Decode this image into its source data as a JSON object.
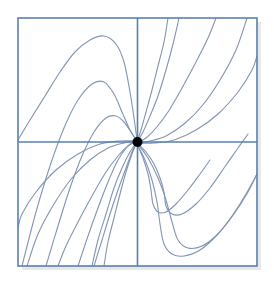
{
  "figure": {
    "alt_text": "Square plot frame with horizontal and vertical axes crossing at a filled black dot at the origin; a family of smooth blue trajectory curves spirals into the origin with 180-degree rotational symmetry.",
    "background_color": "#ffffff"
  },
  "frame": {
    "name": "plot-border",
    "x": 18,
    "y": 18,
    "width": 239,
    "height": 248,
    "stroke_color": "#5b7fb0",
    "stroke_width": 1.6,
    "fill_color": "#ffffff",
    "shadow_color": "#e6e8ea"
  },
  "axes": {
    "x_axis": {
      "label": "horizontal-axis",
      "y": 142,
      "x_start": 18,
      "x_end": 257,
      "stroke_color": "#5b7fb0",
      "stroke_width": 1.6
    },
    "y_axis": {
      "label": "vertical-axis",
      "x": 137.5,
      "y_start": 18,
      "y_end": 266,
      "stroke_color": "#5b7fb0",
      "stroke_width": 1.6
    }
  },
  "critical_point": {
    "name": "origin-node",
    "cx": 137.5,
    "cy": 142,
    "radius": 5,
    "fill_color": "#000000"
  },
  "curve_style": {
    "stroke_color": "#8294b4",
    "stroke_width": 1.1,
    "fill": "none"
  },
  "chart_data": {
    "type": "line",
    "subtitle": "",
    "xlabel": "",
    "ylabel": "",
    "xlim": [
      -4,
      4
    ],
    "ylim": [
      -4,
      4
    ],
    "grid": false,
    "legend": null,
    "annotations": [
      {
        "text": "origin critical point",
        "x": 0,
        "y": 0,
        "marker": "filled-circle"
      }
    ],
    "axis_lines": {
      "x_axis_at_y": 0,
      "y_axis_at_x": 0
    },
    "symmetry": "180-degree rotational (odd symmetry about origin)",
    "series": [
      {
        "name": "trajectory-1-upper-left-outer",
        "quadrant": "upper-left",
        "points": [
          [
            18,
            140
          ],
          [
            30,
            120
          ],
          [
            45,
            96
          ],
          [
            60,
            72
          ],
          [
            75,
            52
          ],
          [
            90,
            40
          ],
          [
            104,
            36
          ],
          [
            116,
            44
          ],
          [
            124,
            62
          ],
          [
            130,
            92
          ],
          [
            134,
            118
          ],
          [
            137,
            140
          ]
        ]
      },
      {
        "name": "trajectory-2-upper-left-mid",
        "quadrant": "upper-left",
        "points": [
          [
            22,
            266
          ],
          [
            36,
            212
          ],
          [
            50,
            166
          ],
          [
            64,
            128
          ],
          [
            78,
            100
          ],
          [
            92,
            84
          ],
          [
            104,
            82
          ],
          [
            114,
            94
          ],
          [
            122,
            112
          ],
          [
            130,
            130
          ],
          [
            137,
            141
          ]
        ]
      },
      {
        "name": "trajectory-3-upper-left-inner",
        "quadrant": "upper-left",
        "points": [
          [
            46,
            266
          ],
          [
            58,
            226
          ],
          [
            70,
            188
          ],
          [
            82,
            156
          ],
          [
            94,
            132
          ],
          [
            106,
            118
          ],
          [
            116,
            116
          ],
          [
            124,
            122
          ],
          [
            131,
            132
          ],
          [
            137,
            141
          ]
        ]
      },
      {
        "name": "trajectory-4-upper-left-innermost",
        "quadrant": "upper-left",
        "points": [
          [
            78,
            266
          ],
          [
            88,
            236
          ],
          [
            98,
            208
          ],
          [
            108,
            182
          ],
          [
            118,
            160
          ],
          [
            127,
            147
          ],
          [
            133,
            142
          ],
          [
            137,
            141
          ]
        ]
      },
      {
        "name": "trajectory-5-left-steep",
        "quadrant": "lower-left-to-origin",
        "points": [
          [
            94,
            266
          ],
          [
            102,
            240
          ],
          [
            110,
            214
          ],
          [
            118,
            190
          ],
          [
            126,
            168
          ],
          [
            132,
            152
          ],
          [
            137,
            141
          ]
        ]
      },
      {
        "name": "trajectory-6-upper-right-steep-inner",
        "quadrant": "upper-right",
        "points": [
          [
            137,
            142
          ],
          [
            141,
            130
          ],
          [
            146,
            112
          ],
          [
            152,
            90
          ],
          [
            158,
            66
          ],
          [
            164,
            42
          ],
          [
            168,
            18
          ]
        ]
      },
      {
        "name": "trajectory-7-upper-right-steep",
        "quadrant": "upper-right",
        "points": [
          [
            137,
            142
          ],
          [
            143,
            132
          ],
          [
            150,
            116
          ],
          [
            158,
            96
          ],
          [
            166,
            70
          ],
          [
            173,
            44
          ],
          [
            179,
            18
          ]
        ]
      },
      {
        "name": "trajectory-8-upper-right-mid",
        "quadrant": "upper-right",
        "points": [
          [
            137,
            143
          ],
          [
            146,
            138
          ],
          [
            156,
            128
          ],
          [
            168,
            112
          ],
          [
            182,
            88
          ],
          [
            196,
            62
          ],
          [
            208,
            38
          ],
          [
            216,
            18
          ]
        ]
      },
      {
        "name": "trajectory-9-upper-right-outer",
        "quadrant": "upper-right",
        "points": [
          [
            137,
            143
          ],
          [
            150,
            141
          ],
          [
            166,
            136
          ],
          [
            184,
            124
          ],
          [
            202,
            106
          ],
          [
            220,
            80
          ],
          [
            236,
            50
          ],
          [
            247,
            18
          ]
        ]
      },
      {
        "name": "trajectory-10-right-shallow",
        "quadrant": "upper-right",
        "points": [
          [
            137,
            143
          ],
          [
            154,
            143
          ],
          [
            174,
            140
          ],
          [
            196,
            130
          ],
          [
            218,
            114
          ],
          [
            238,
            92
          ],
          [
            252,
            70
          ],
          [
            257,
            56
          ]
        ]
      },
      {
        "name": "trajectory-11-lower-right-inner",
        "quadrant": "lower-right",
        "points": [
          [
            137,
            143
          ],
          [
            146,
            152
          ],
          [
            154,
            164
          ],
          [
            160,
            178
          ],
          [
            164,
            192
          ],
          [
            166,
            206
          ],
          [
            172,
            214
          ],
          [
            182,
            214
          ],
          [
            196,
            204
          ],
          [
            210,
            188
          ],
          [
            224,
            168
          ],
          [
            238,
            148
          ],
          [
            248,
            134
          ]
        ]
      },
      {
        "name": "trajectory-12-lower-right-mid",
        "quadrant": "lower-right",
        "points": [
          [
            137,
            143
          ],
          [
            148,
            158
          ],
          [
            158,
            178
          ],
          [
            166,
            200
          ],
          [
            172,
            222
          ],
          [
            178,
            240
          ],
          [
            188,
            248
          ],
          [
            202,
            246
          ],
          [
            218,
            234
          ],
          [
            234,
            214
          ],
          [
            248,
            192
          ],
          [
            257,
            174
          ]
        ]
      },
      {
        "name": "trajectory-13-lower-right-outer",
        "quadrant": "lower-right",
        "points": [
          [
            137,
            144
          ],
          [
            145,
            160
          ],
          [
            152,
            180
          ],
          [
            157,
            202
          ],
          [
            160,
            224
          ],
          [
            164,
            244
          ],
          [
            172,
            254
          ],
          [
            184,
            256
          ],
          [
            200,
            250
          ],
          [
            216,
            236
          ],
          [
            232,
            216
          ],
          [
            246,
            194
          ],
          [
            257,
            174
          ]
        ]
      },
      {
        "name": "trajectory-14-lower-right-short",
        "quadrant": "lower-right",
        "points": [
          [
            137,
            144
          ],
          [
            143,
            158
          ],
          [
            148,
            174
          ],
          [
            151,
            190
          ],
          [
            153,
            204
          ],
          [
            158,
            212
          ],
          [
            166,
            212
          ],
          [
            176,
            204
          ],
          [
            188,
            190
          ],
          [
            200,
            174
          ],
          [
            210,
            160
          ]
        ]
      },
      {
        "name": "trajectory-15-lower-left-steep",
        "quadrant": "lower-left",
        "points": [
          [
            137,
            142
          ],
          [
            132,
            154
          ],
          [
            126,
            172
          ],
          [
            120,
            194
          ],
          [
            114,
            218
          ],
          [
            108,
            242
          ],
          [
            104,
            266
          ]
        ]
      },
      {
        "name": "trajectory-16-lower-left-steep-2",
        "quadrant": "lower-left",
        "points": [
          [
            137,
            142
          ],
          [
            130,
            152
          ],
          [
            122,
            168
          ],
          [
            114,
            188
          ],
          [
            106,
            214
          ],
          [
            98,
            240
          ],
          [
            92,
            266
          ]
        ]
      },
      {
        "name": "trajectory-17-lower-left-mid",
        "quadrant": "lower-left",
        "points": [
          [
            137,
            141
          ],
          [
            128,
            146
          ],
          [
            118,
            156
          ],
          [
            106,
            172
          ],
          [
            92,
            196
          ],
          [
            78,
            222
          ],
          [
            66,
            246
          ],
          [
            58,
            266
          ]
        ]
      },
      {
        "name": "trajectory-18-lower-left-outer",
        "quadrant": "lower-left",
        "points": [
          [
            137,
            141
          ],
          [
            124,
            143
          ],
          [
            108,
            148
          ],
          [
            90,
            160
          ],
          [
            72,
            178
          ],
          [
            54,
            204
          ],
          [
            38,
            234
          ],
          [
            27,
            266
          ]
        ]
      },
      {
        "name": "trajectory-19-left-shallow",
        "quadrant": "lower-left",
        "points": [
          [
            137,
            141
          ],
          [
            120,
            141
          ],
          [
            100,
            144
          ],
          [
            78,
            154
          ],
          [
            56,
            170
          ],
          [
            36,
            192
          ],
          [
            22,
            214
          ],
          [
            18,
            228
          ]
        ]
      }
    ]
  }
}
